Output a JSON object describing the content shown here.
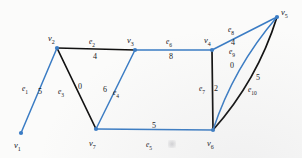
{
  "figure": {
    "kind": "weighted-undirected-graph-diagram",
    "width": 302,
    "height": 158,
    "background_color": "#fbfbfa",
    "blue_color": "#3a7cc4",
    "black_color": "#111111"
  },
  "nodes": [
    {
      "id": "v1",
      "label": "v",
      "sub": "1",
      "x": 21,
      "y": 133,
      "label_x": 14,
      "label_y": 141
    },
    {
      "id": "v2",
      "label": "v",
      "sub": "2",
      "x": 57,
      "y": 48,
      "label_x": 48,
      "label_y": 34
    },
    {
      "id": "v3",
      "label": "v",
      "sub": "3",
      "x": 135,
      "y": 50,
      "label_x": 127,
      "label_y": 36
    },
    {
      "id": "v4",
      "label": "v",
      "sub": "4",
      "x": 212,
      "y": 50,
      "label_x": 204,
      "label_y": 36
    },
    {
      "id": "v5",
      "label": "v",
      "sub": "5",
      "x": 277,
      "y": 17,
      "label_x": 281,
      "label_y": 8
    },
    {
      "id": "v6",
      "label": "v",
      "sub": "6",
      "x": 213,
      "y": 130,
      "label_x": 207,
      "label_y": 139
    },
    {
      "id": "v7",
      "label": "v",
      "sub": "7",
      "x": 96,
      "y": 129,
      "label_x": 89,
      "label_y": 139
    }
  ],
  "edges": [
    {
      "id": "e1",
      "label": "e",
      "sub": "1",
      "weight": "5",
      "from": "v1",
      "to": "v2",
      "color": "blue",
      "curved": false,
      "label_x": 22,
      "label_y": 85,
      "weight_x": 38,
      "weight_y": 88
    },
    {
      "id": "e2",
      "label": "e",
      "sub": "2",
      "weight": "4",
      "from": "v2",
      "to": "v3",
      "color": "black",
      "curved": false,
      "label_x": 89,
      "label_y": 38,
      "weight_x": 93,
      "weight_y": 53
    },
    {
      "id": "e3",
      "label": "e",
      "sub": "3",
      "weight": "0",
      "from": "v2",
      "to": "v7",
      "color": "black",
      "curved": false,
      "label_x": 58,
      "label_y": 88,
      "weight_x": 78,
      "weight_y": 83
    },
    {
      "id": "e4",
      "label": "e",
      "sub": "4",
      "weight": "6",
      "from": "v7",
      "to": "v3",
      "color": "blue",
      "curved": false,
      "label_x": 113,
      "label_y": 89,
      "weight_x": 103,
      "weight_y": 86
    },
    {
      "id": "e5",
      "label": "e",
      "sub": "5",
      "weight": "5",
      "from": "v7",
      "to": "v6",
      "color": "blue",
      "curved": false,
      "label_x": 146,
      "label_y": 141,
      "weight_x": 152,
      "weight_y": 122
    },
    {
      "id": "e6",
      "label": "e",
      "sub": "6",
      "weight": "8",
      "from": "v3",
      "to": "v4",
      "color": "blue",
      "curved": false,
      "label_x": 166,
      "label_y": 38,
      "weight_x": 169,
      "weight_y": 53
    },
    {
      "id": "e7",
      "label": "e",
      "sub": "7",
      "weight": "2",
      "from": "v4",
      "to": "v6",
      "color": "black",
      "curved": false,
      "label_x": 199,
      "label_y": 85,
      "weight_x": 214,
      "weight_y": 85
    },
    {
      "id": "e8",
      "label": "e",
      "sub": "8",
      "weight": "4",
      "from": "v4",
      "to": "v5",
      "color": "blue",
      "curved": false,
      "label_x": 228,
      "label_y": 26,
      "weight_x": 231,
      "weight_y": 39
    },
    {
      "id": "e9",
      "label": "e",
      "sub": "9",
      "weight": "0",
      "from": "v6",
      "to": "v5",
      "color": "black",
      "curved": true,
      "label_x": 229,
      "label_y": 48,
      "weight_x": 230,
      "weight_y": 62
    },
    {
      "id": "e10",
      "label": "e",
      "sub": "10",
      "weight": "5",
      "from": "v6",
      "to": "v5",
      "color": "blue",
      "curved": true,
      "label_x": 248,
      "label_y": 86,
      "weight_x": 256,
      "weight_y": 74
    }
  ]
}
